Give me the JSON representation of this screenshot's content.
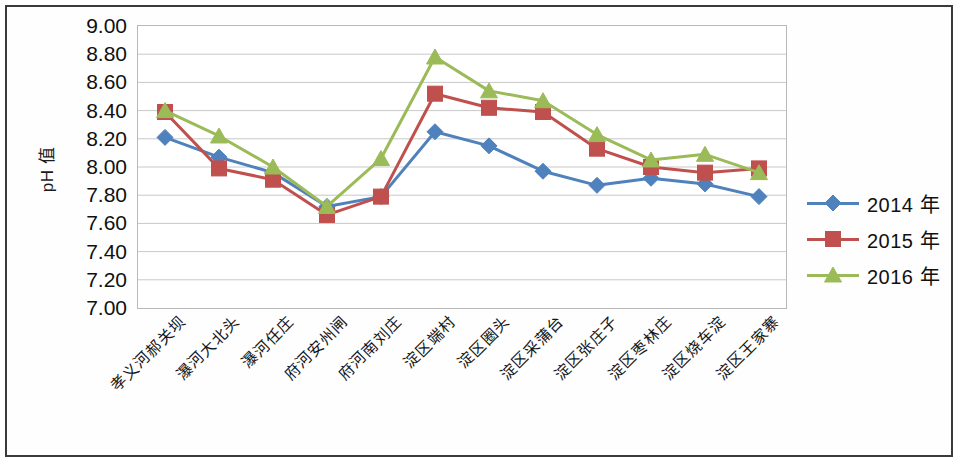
{
  "chart_data": {
    "type": "line",
    "title": "",
    "xlabel": "",
    "ylabel": "pH 值",
    "ylim": [
      7.0,
      9.0
    ],
    "ystep": 0.2,
    "grid": true,
    "legend_position": "right",
    "y_ticks": [
      "9.00",
      "8.80",
      "8.60",
      "8.40",
      "8.20",
      "8.00",
      "7.80",
      "7.60",
      "7.40",
      "7.20",
      "7.00"
    ],
    "categories": [
      "孝义河郝关坝",
      "瀑河大北头",
      "瀑河任庄",
      "府河安州闸",
      "府河南刘庄",
      "淀区端村",
      "淀区圈头",
      "淀区采蒲台",
      "淀区张庄子",
      "淀区枣林庄",
      "淀区烧车淀",
      "淀区王家寨"
    ],
    "series": [
      {
        "name": "2014 年",
        "color": "#4f81bd",
        "marker": "diamond",
        "values": [
          8.21,
          8.07,
          7.96,
          7.72,
          7.79,
          8.25,
          8.15,
          7.97,
          7.87,
          7.92,
          7.88,
          7.79
        ]
      },
      {
        "name": "2015 年",
        "color": "#c0504d",
        "marker": "square",
        "values": [
          8.39,
          7.99,
          7.91,
          7.66,
          7.79,
          8.52,
          8.42,
          8.39,
          8.13,
          8.0,
          7.96,
          7.99
        ]
      },
      {
        "name": "2016 年",
        "color": "#9bbb59",
        "marker": "triangle",
        "values": [
          8.4,
          8.22,
          8.0,
          7.72,
          8.06,
          8.78,
          8.54,
          8.47,
          8.23,
          8.05,
          8.09,
          7.96
        ]
      }
    ]
  },
  "legend": {
    "items": [
      {
        "label": "2014 年",
        "color": "#4f81bd",
        "marker": "diamond"
      },
      {
        "label": "2015 年",
        "color": "#c0504d",
        "marker": "square"
      },
      {
        "label": "2016 年",
        "color": "#9bbb59",
        "marker": "triangle"
      }
    ]
  },
  "colors": {
    "series_2014": "#4f81bd",
    "series_2015": "#c0504d",
    "series_2016": "#9bbb59",
    "gridline": "#c8c8c8",
    "plot_border": "#b9b9b9",
    "frame": "#3a3a3a",
    "text": "#101010"
  }
}
